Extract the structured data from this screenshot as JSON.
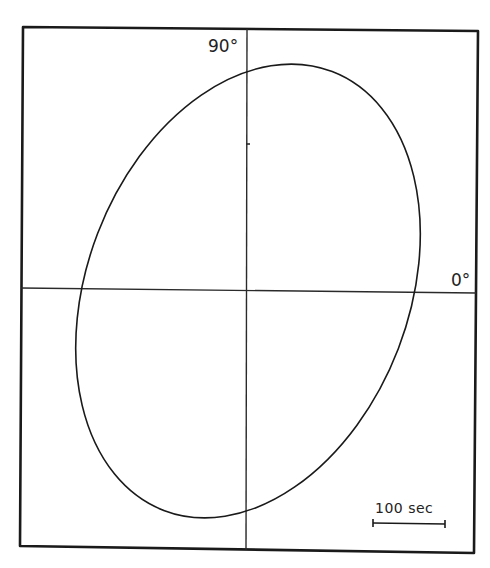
{
  "figure": {
    "type": "phase-ellipse",
    "labels": {
      "vertical_axis": "90°",
      "horizontal_axis": "0°"
    },
    "scale_bar": {
      "label": "100 sec"
    },
    "colors": {
      "line": "#1a1a1a",
      "background": "#ffffff"
    }
  }
}
